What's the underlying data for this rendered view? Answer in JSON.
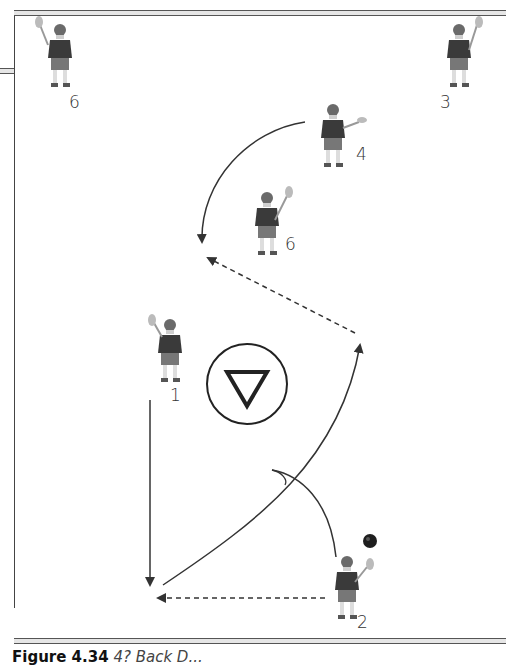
{
  "figure": {
    "label": "Figure 4.34",
    "title": "4? Back D...",
    "partially_clipped": true
  },
  "diagram": {
    "goal_crease_symbol": "inverted-triangle-in-circle",
    "players": [
      {
        "number": "1",
        "x": 173,
        "y": 355
      },
      {
        "number": "2",
        "x": 351,
        "y": 590
      },
      {
        "number": "3",
        "x": 459,
        "y": 60
      },
      {
        "number": "4",
        "x": 333,
        "y": 140
      },
      {
        "number": "5",
        "x": 60,
        "y": 60
      },
      {
        "number": "6",
        "x": 267,
        "y": 225
      }
    ],
    "ball": {
      "x": 370,
      "y": 540
    },
    "legend": {
      "solid_arrow": "player movement",
      "dashed_arrow": "pass",
      "cut_arc": "dodge"
    },
    "colors": {
      "line": "#333333",
      "jersey": "#3a3a3a",
      "shorts": "#777777",
      "skin": "#cfcfcf"
    }
  }
}
